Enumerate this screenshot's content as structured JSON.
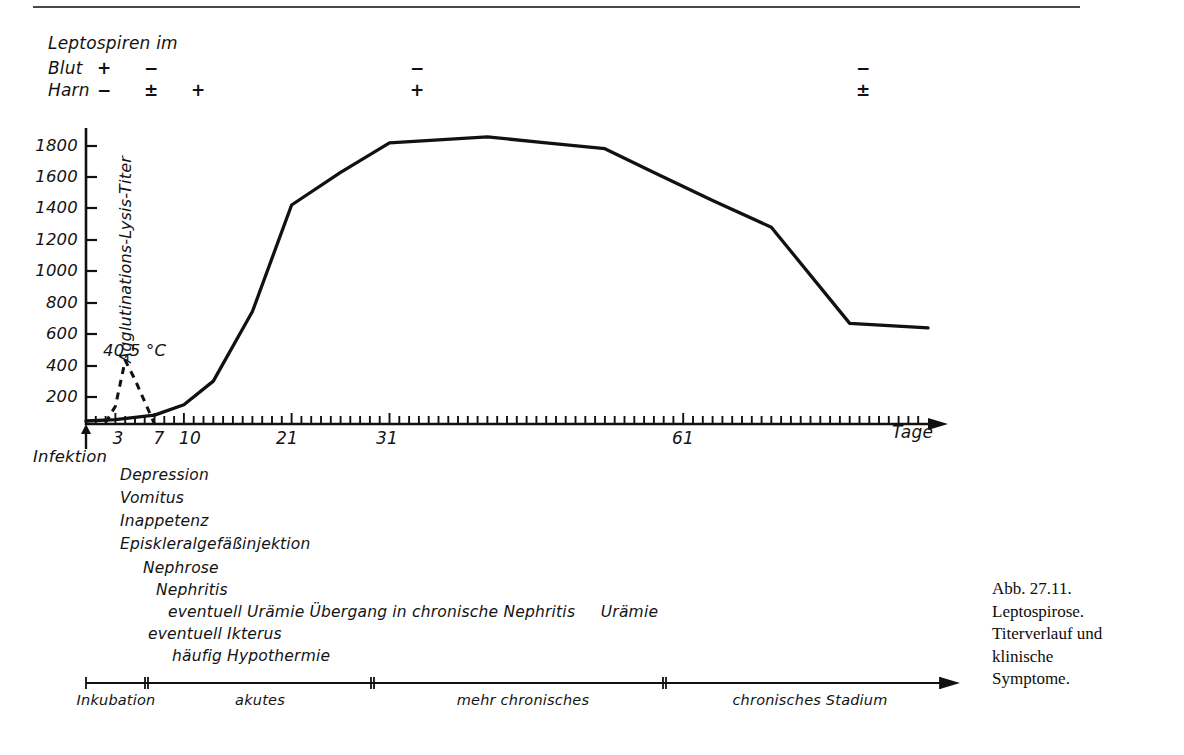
{
  "figure": {
    "caption_lines": [
      "Abb. 27.11.",
      "Leptospirose.",
      "Titerverlauf und",
      "klinische",
      "Symptome."
    ]
  },
  "leptospiren": {
    "title": "Leptospiren im",
    "rows": [
      {
        "label": "Blut",
        "marks": [
          "+",
          "−",
          "",
          "−",
          "−"
        ]
      },
      {
        "label": "Harn",
        "marks": [
          "−",
          "±",
          "+",
          "+",
          "±"
        ]
      }
    ]
  },
  "axes": {
    "ylabel": "Agglutinations-Lysis-Titer",
    "yticks": [
      "1800",
      "1600",
      "1400",
      "1200",
      "1000",
      "800",
      "600",
      "400",
      "200"
    ],
    "xticks": [
      "3",
      "7",
      "10",
      "21",
      "31",
      "61"
    ],
    "xunit": "Tage",
    "origin_label": "Infektion",
    "fever_label": "40,5 °C"
  },
  "symptoms": [
    {
      "text": "Depression",
      "x": 120,
      "y": 466
    },
    {
      "text": "Vomitus",
      "x": 120,
      "y": 489
    },
    {
      "text": "Inappetenz",
      "x": 120,
      "y": 512
    },
    {
      "text": "Episkleralgefäßinjektion",
      "x": 120,
      "y": 535
    },
    {
      "text": "Nephrose",
      "x": 143,
      "y": 559
    },
    {
      "text": "Nephritis",
      "x": 156,
      "y": 581
    },
    {
      "text": "eventuell Urämie Übergang in chronische Nephritis     Urämie",
      "x": 168,
      "y": 603
    },
    {
      "text": "eventuell Ikterus",
      "x": 148,
      "y": 625
    },
    {
      "text": "häufig Hypothermie",
      "x": 172,
      "y": 647
    }
  ],
  "stages": [
    {
      "label": "Inkubation",
      "start": 86,
      "end": 145
    },
    {
      "label": "akutes",
      "start": 148,
      "end": 371
    },
    {
      "label": "mehr chronisches",
      "start": 374,
      "end": 663
    },
    {
      "label": "chronisches Stadium",
      "start": 666,
      "end": 940
    }
  ],
  "chart_data": {
    "type": "line",
    "xlabel": "Tage",
    "ylabel": "Agglutinations-Lysis-Titer",
    "xlim": [
      0,
      86
    ],
    "ylim": [
      0,
      2000
    ],
    "xticks": [
      3,
      7,
      10,
      21,
      31,
      61
    ],
    "yticks": [
      200,
      400,
      600,
      800,
      1000,
      1200,
      1400,
      1600,
      1800
    ],
    "grid": false,
    "legend": "none",
    "series": [
      {
        "name": "Agglutinations-Lysis-Titer",
        "style": "solid",
        "x": [
          0,
          3,
          7,
          10,
          13,
          17,
          21,
          26,
          31,
          36,
          41,
          47,
          53,
          58,
          64,
          70,
          78,
          86
        ],
        "y": [
          20,
          30,
          60,
          130,
          290,
          760,
          1480,
          1700,
          1900,
          1920,
          1940,
          1900,
          1860,
          1700,
          1510,
          1330,
          680,
          650
        ]
      },
      {
        "name": "Fieber (Temperatur)",
        "style": "dashed",
        "annotation": "40,5 °C",
        "x": [
          2,
          3,
          4,
          5,
          7
        ],
        "y": [
          10,
          120,
          430,
          300,
          0
        ]
      }
    ],
    "annotations": [
      {
        "text": "Infektion",
        "x": 0,
        "type": "arrow-up"
      },
      {
        "text": "40,5 °C",
        "x": 4,
        "y": 430
      }
    ]
  }
}
